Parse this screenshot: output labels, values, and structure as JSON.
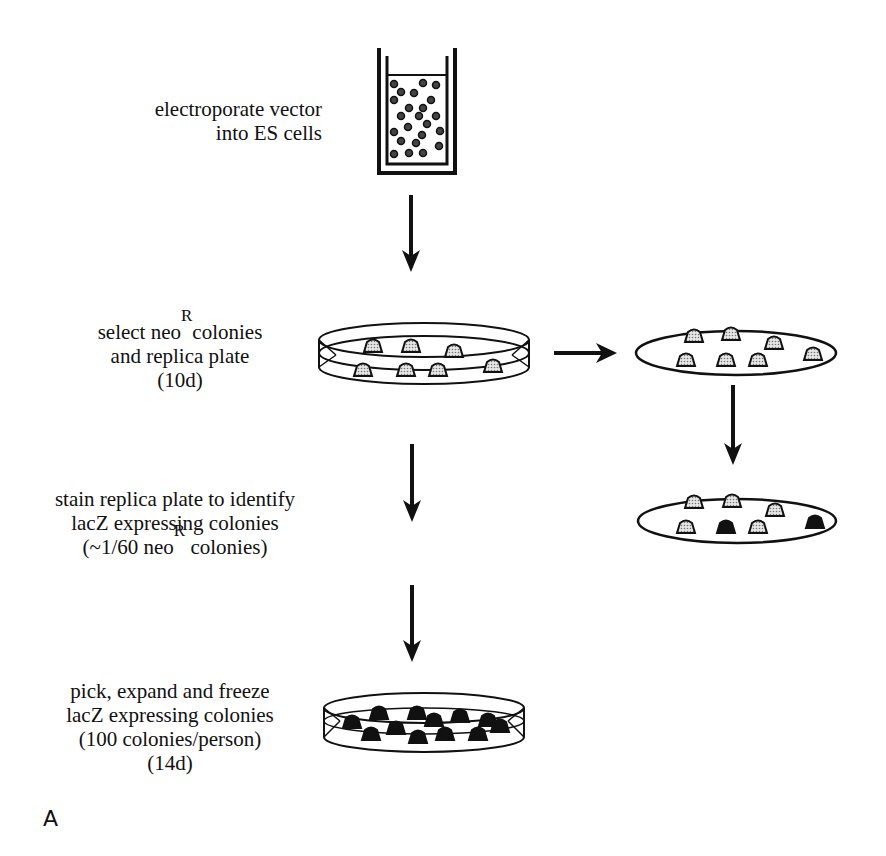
{
  "steps": [
    {
      "line1": "electroporate vector",
      "line2": "into ES cells"
    },
    {
      "line1_pre": "select neo",
      "line1_sup": "R",
      "line1_post": "colonies",
      "line2": "and replica plate",
      "line3": "(10d)"
    },
    {
      "line1": "stain replica plate to identify",
      "line2": "lacZ expressing colonies",
      "line3_pre": "(~1/60 neo",
      "line3_sup": "R",
      "line3_post": " colonies)"
    },
    {
      "line1": "pick, expand and freeze",
      "line2": "lacZ expressing colonies",
      "line3": "(100 colonies/person)",
      "line4": "(14d)"
    }
  ],
  "panel_label": "A",
  "colors": {
    "ink": "#111111",
    "stipple": "#bdbdbd",
    "stained": "#111111"
  }
}
